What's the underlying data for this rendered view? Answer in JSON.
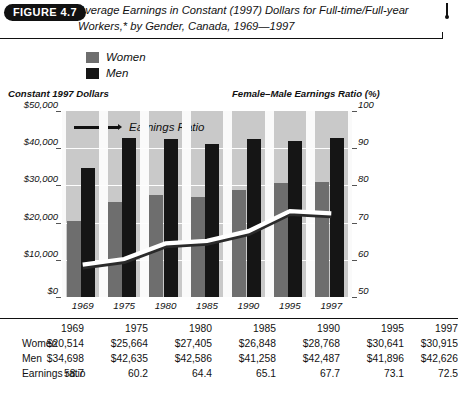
{
  "figure": {
    "badge": "FIGURE 4.7",
    "title": "Average Earnings in Constant (1997) Dollars for Full-time/Full-year Workers,* by Gender, Canada, 1969—1997"
  },
  "legend": {
    "items": [
      {
        "label": "Women",
        "color": "#6e6e6e"
      },
      {
        "label": "Men",
        "color": "#151515"
      }
    ],
    "line_label": "Earnings Ratio"
  },
  "axes": {
    "left_title": "Constant 1997 Dollars",
    "right_title": "Female–Male Earnings Ratio (%)",
    "left_ticks": [
      "$50,000",
      "$40,000",
      "$30,000",
      "$20,000",
      "$10,000",
      "$0"
    ],
    "right_ticks": [
      "100",
      "90",
      "80",
      "70",
      "60",
      "50"
    ]
  },
  "chart_data": {
    "type": "bar",
    "title": "Average Earnings in Constant (1997) Dollars for Full-time/Full-year Workers,* by Gender, Canada, 1969—1997",
    "xlabel": "",
    "ylabel": "Constant 1997 Dollars",
    "y2label": "Female–Male Earnings Ratio (%)",
    "categories": [
      "1969",
      "1975",
      "1980",
      "1985",
      "1990",
      "1995",
      "1997"
    ],
    "ylim": [
      0,
      50000
    ],
    "y2lim": [
      50,
      100
    ],
    "grid": true,
    "legend_position": "top-left",
    "series": [
      {
        "name": "Women",
        "type": "bar",
        "axis": "left",
        "color": "#6e6e6e",
        "values": [
          20514,
          25664,
          27405,
          26848,
          28768,
          30641,
          30915
        ]
      },
      {
        "name": "Men",
        "type": "bar",
        "axis": "left",
        "color": "#151515",
        "values": [
          34698,
          42635,
          42586,
          41258,
          42487,
          41896,
          42626
        ]
      },
      {
        "name": "Earnings Ratio",
        "type": "line",
        "axis": "right",
        "color": "#ffffff",
        "values": [
          58.7,
          60.2,
          64.4,
          65.1,
          67.7,
          73.1,
          72.5
        ]
      }
    ]
  },
  "table": {
    "header": [
      "",
      "1969",
      "1975",
      "1980",
      "1985",
      "1990",
      "1995",
      "1997"
    ],
    "rows": [
      {
        "label": "Women",
        "values": [
          "$20,514",
          "$25,664",
          "$27,405",
          "$26,848",
          "$28,768",
          "$30,641",
          "$30,915"
        ]
      },
      {
        "label": "Men",
        "values": [
          "$34,698",
          "$42,635",
          "$42,586",
          "$41,258",
          "$42,487",
          "$41,896",
          "$42,626"
        ]
      },
      {
        "label": "Earnings ratio",
        "values": [
          "58.7",
          "60.2",
          "64.4",
          "65.1",
          "67.7",
          "73.1",
          "72.5"
        ]
      }
    ]
  }
}
